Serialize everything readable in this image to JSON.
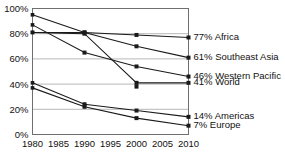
{
  "chart_data": {
    "type": "line",
    "title": "",
    "xlabel": "",
    "ylabel": "",
    "x": [
      1980,
      1990,
      2000,
      2010
    ],
    "xlim": [
      1980,
      2010
    ],
    "ylim": [
      0,
      100
    ],
    "x_ticks": [
      "1980",
      "1985",
      "1990",
      "1995",
      "2000",
      "2005",
      "2010"
    ],
    "x_tick_values": [
      1980,
      1985,
      1990,
      1995,
      2000,
      2005,
      2010
    ],
    "y_ticks": [
      "0%",
      "20%",
      "40%",
      "60%",
      "80%",
      "100%"
    ],
    "y_tick_values": [
      0,
      20,
      40,
      60,
      80,
      100
    ],
    "grid": "horizontal",
    "legend_position": "right-inline-endpoint",
    "series": [
      {
        "name": "Africa",
        "end_label": "77% Africa",
        "end_value": 77,
        "values": [
          81,
          81,
          79,
          77
        ]
      },
      {
        "name": "Southeast Asia",
        "end_label": "61% Southeast Asia",
        "end_value": 61,
        "values": [
          95,
          81,
          70,
          61
        ]
      },
      {
        "name": "Western Pacific",
        "end_label": "46% Western Pacific",
        "end_value": 46,
        "values": [
          87,
          65,
          54,
          46
        ]
      },
      {
        "name": "World",
        "end_label": "41% World",
        "end_value": 41,
        "values": [
          81,
          80,
          41,
          41
        ],
        "note": "flat segment at 41% with isolated marker near 2000"
      },
      {
        "name": "Americas",
        "end_label": "14% Americas",
        "end_value": 14,
        "values": [
          41,
          24,
          19,
          14
        ]
      },
      {
        "name": "Europe",
        "end_label": "7% Europe",
        "end_value": 7,
        "values": [
          37,
          22,
          13,
          7
        ]
      }
    ],
    "extra_markers": [
      {
        "series": "World",
        "x": 2000,
        "y": 38
      }
    ],
    "colors": {
      "line": "#1a1a1a",
      "grid": "#9a9a9a",
      "frame": "#6f6f6f",
      "text": "#111111",
      "background": "#ffffff"
    }
  }
}
